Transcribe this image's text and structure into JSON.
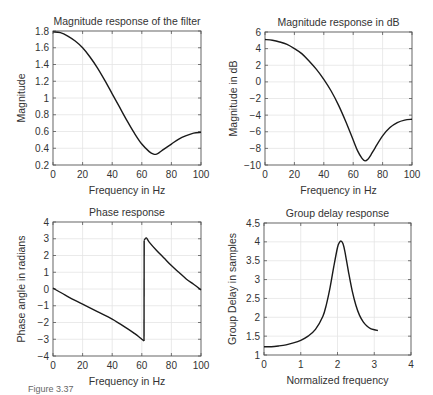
{
  "figure": {
    "caption": "Figure 3.37"
  },
  "chart_data": [
    {
      "id": "mag",
      "type": "line",
      "title": "Magnitude response of the filter",
      "xlabel": "Frequency in Hz",
      "ylabel": "Magnitude",
      "xlim": [
        0,
        100
      ],
      "ylim": [
        0.2,
        1.8
      ],
      "xticks": [
        0,
        20,
        40,
        60,
        80,
        100
      ],
      "xtick_labels": [
        "0",
        "20",
        "40",
        "60",
        "80",
        "100"
      ],
      "yticks": [
        0.2,
        0.4,
        0.6,
        0.8,
        1.0,
        1.2,
        1.4,
        1.6,
        1.8
      ],
      "ytick_labels": [
        "0.2",
        "0.4",
        "0.6",
        "0.8",
        "1",
        "1.2",
        "1.4",
        "1.6",
        "1.8"
      ],
      "grid": true,
      "box": {
        "x0": 53,
        "y0": 31,
        "x1": 201,
        "y1": 165
      },
      "x": [
        0,
        5,
        10,
        15,
        20,
        25,
        30,
        35,
        40,
        45,
        50,
        55,
        60,
        65,
        68,
        70,
        72,
        75,
        80,
        85,
        90,
        95,
        100
      ],
      "values": [
        1.79,
        1.78,
        1.74,
        1.68,
        1.6,
        1.49,
        1.36,
        1.21,
        1.05,
        0.89,
        0.73,
        0.58,
        0.45,
        0.36,
        0.33,
        0.33,
        0.35,
        0.39,
        0.45,
        0.51,
        0.55,
        0.58,
        0.59
      ]
    },
    {
      "id": "magdb",
      "type": "line",
      "title": "Magnitude response in dB",
      "xlabel": "Frequency in Hz",
      "ylabel": "Magnitude in dB",
      "xlim": [
        0,
        100
      ],
      "ylim": [
        -10,
        6
      ],
      "xticks": [
        0,
        20,
        40,
        60,
        80,
        100
      ],
      "xtick_labels": [
        "0",
        "20",
        "40",
        "60",
        "80",
        "100"
      ],
      "yticks": [
        -10,
        -8,
        -6,
        -4,
        -2,
        0,
        2,
        4,
        6
      ],
      "ytick_labels": [
        "−10",
        "−8",
        "−6",
        "−4",
        "−2",
        "0",
        "2",
        "4",
        "6"
      ],
      "grid": true,
      "box": {
        "x0": 265,
        "y0": 32,
        "x1": 412,
        "y1": 165
      },
      "x": [
        0,
        5,
        10,
        15,
        20,
        25,
        30,
        35,
        40,
        45,
        50,
        55,
        60,
        63,
        66,
        68,
        70,
        72,
        75,
        80,
        85,
        90,
        95,
        100
      ],
      "values": [
        5.1,
        5.0,
        4.8,
        4.5,
        4.0,
        3.4,
        2.5,
        1.5,
        0.3,
        -1.1,
        -2.8,
        -4.8,
        -7.0,
        -8.3,
        -9.2,
        -9.5,
        -9.3,
        -8.8,
        -7.9,
        -6.5,
        -5.5,
        -4.9,
        -4.6,
        -4.5
      ]
    },
    {
      "id": "phase",
      "type": "line",
      "title": "Phase response",
      "xlabel": "Frequency in Hz",
      "ylabel": "Phase angle in radians",
      "xlim": [
        0,
        100
      ],
      "ylim": [
        -4,
        4
      ],
      "xticks": [
        0,
        20,
        40,
        60,
        80,
        100
      ],
      "xtick_labels": [
        "0",
        "20",
        "40",
        "60",
        "80",
        "100"
      ],
      "yticks": [
        -4,
        -3,
        -2,
        -1,
        0,
        1,
        2,
        3,
        4
      ],
      "ytick_labels": [
        "−4",
        "−3",
        "−2",
        "−1",
        "0",
        "1",
        "2",
        "3",
        "4"
      ],
      "grid": true,
      "box": {
        "x0": 53,
        "y0": 222,
        "x1": 201,
        "y1": 356
      },
      "x": [
        0,
        10,
        20,
        30,
        40,
        50,
        55,
        58,
        60,
        61.5,
        61.6,
        63,
        65,
        70,
        75,
        80,
        85,
        90,
        95,
        100
      ],
      "values": [
        0.05,
        -0.45,
        -0.9,
        -1.35,
        -1.8,
        -2.35,
        -2.65,
        -2.85,
        -3.0,
        -3.1,
        2.9,
        3.05,
        2.8,
        2.3,
        1.85,
        1.4,
        1.0,
        0.6,
        0.28,
        -0.05
      ]
    },
    {
      "id": "gd",
      "type": "line",
      "title": "Group delay response",
      "xlabel": "Normalized frequency",
      "ylabel": "Group Delay in samples",
      "xlim": [
        0,
        4
      ],
      "ylim": [
        1,
        4.5
      ],
      "xticks": [
        0,
        1,
        2,
        3,
        4
      ],
      "xtick_labels": [
        "0",
        "1",
        "2",
        "3",
        "4"
      ],
      "yticks": [
        1,
        1.5,
        2,
        2.5,
        3,
        3.5,
        4,
        4.5
      ],
      "ytick_labels": [
        "1",
        "1.5",
        "2",
        "2.5",
        "3",
        "3.5",
        "4",
        "4.5"
      ],
      "grid": true,
      "box": {
        "x0": 264,
        "y0": 223,
        "x1": 411,
        "y1": 355
      },
      "x": [
        0,
        0.2,
        0.4,
        0.6,
        0.8,
        1.0,
        1.2,
        1.4,
        1.6,
        1.7,
        1.8,
        1.9,
        2.0,
        2.05,
        2.1,
        2.15,
        2.2,
        2.3,
        2.4,
        2.5,
        2.6,
        2.7,
        2.8,
        2.9,
        3.0,
        3.1
      ],
      "values": [
        1.22,
        1.22,
        1.24,
        1.27,
        1.32,
        1.39,
        1.5,
        1.68,
        2.02,
        2.35,
        2.8,
        3.35,
        3.85,
        3.98,
        4.02,
        3.95,
        3.75,
        3.2,
        2.7,
        2.32,
        2.05,
        1.88,
        1.77,
        1.7,
        1.67,
        1.65
      ]
    }
  ]
}
